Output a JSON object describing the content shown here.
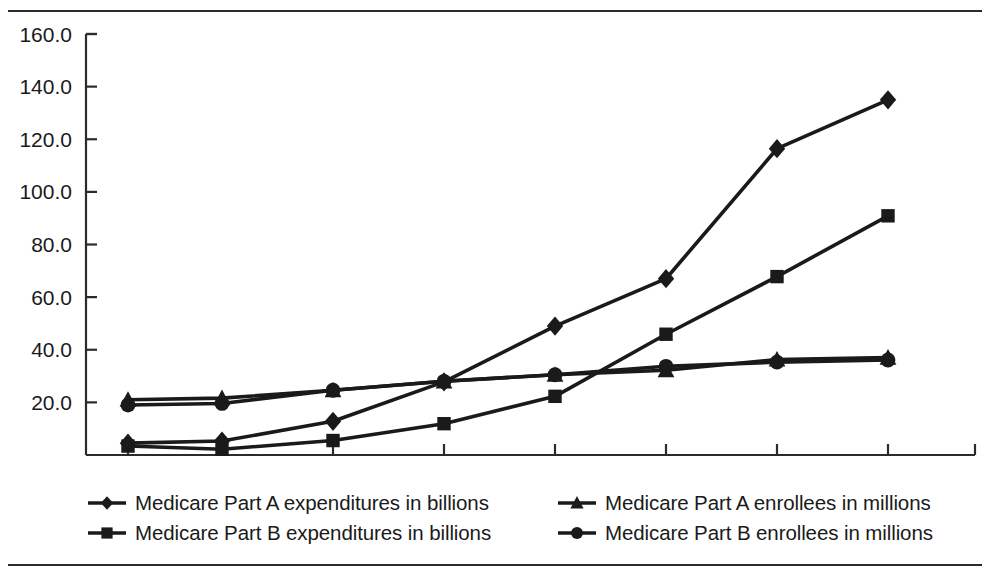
{
  "chart_data": {
    "type": "line",
    "title": "",
    "subtitle": "",
    "xlabel": "",
    "ylabel": "",
    "categories": [
      "1967",
      "1970",
      "1975",
      "1980",
      "1985",
      "1990",
      "1995",
      "1998"
    ],
    "x_tick_labels": [
      "1967",
      "1970",
      "1975",
      "1980",
      "1985",
      "1990",
      "1995",
      "1998"
    ],
    "y_tick_labels": [
      "20.0",
      "40.0",
      "60.0",
      "80.0",
      "100.0",
      "120.0",
      "140.0",
      "160.0"
    ],
    "y_tick_values": [
      20,
      40,
      60,
      80,
      100,
      120,
      140,
      160
    ],
    "ylim": [
      0,
      160
    ],
    "grid": false,
    "legend_position": "bottom",
    "series": [
      {
        "name": "Medicare Part A expenditures in billions",
        "marker": "diamond",
        "values": [
          4.5,
          5.3,
          12.8,
          27.8,
          49.0,
          67.0,
          116.4,
          135.0
        ]
      },
      {
        "name": "Medicare Part B expenditures in billions",
        "marker": "square",
        "values": [
          3.4,
          2.2,
          5.5,
          11.9,
          22.3,
          45.9,
          67.8,
          90.9
        ]
      },
      {
        "name": "Medicare Part A enrollees in millions",
        "marker": "triangle",
        "values": [
          21.0,
          21.6,
          24.6,
          28.0,
          30.5,
          32.2,
          36.3,
          37.0
        ]
      },
      {
        "name": "Medicare Part B enrollees in millions",
        "marker": "circle",
        "values": [
          19.0,
          19.6,
          24.6,
          28.0,
          30.5,
          33.7,
          35.3,
          36.1
        ]
      }
    ]
  },
  "legend": {
    "entries": [
      {
        "label": "Medicare Part A expenditures in billions",
        "marker": "diamond"
      },
      {
        "label": "Medicare Part B expenditures in billions",
        "marker": "square"
      },
      {
        "label": "Medicare Part A enrollees in millions",
        "marker": "triangle"
      },
      {
        "label": "Medicare Part B enrollees in millions",
        "marker": "circle"
      }
    ]
  },
  "colors": {
    "line": "#1a1a1a",
    "axis": "#2b2b2b",
    "background": "#ffffff",
    "text": "#1a1a1a"
  }
}
